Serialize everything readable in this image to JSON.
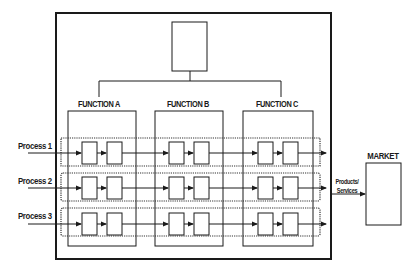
{
  "diagram": {
    "type": "process-function matrix organization diagram",
    "top_box": {
      "label": ""
    },
    "functions": [
      {
        "label": "FUNCTION A"
      },
      {
        "label": "FUNCTION B"
      },
      {
        "label": "FUNCTION C"
      }
    ],
    "processes": [
      {
        "label": "Process 1"
      },
      {
        "label": "Process 2"
      },
      {
        "label": "Process 3"
      }
    ],
    "output": {
      "label_line1": "Products/",
      "label_line2": "Services"
    },
    "market": {
      "label": "MARKET"
    },
    "colors": {
      "line": "#1a1a1a",
      "dotted": "#333333",
      "background": "#ffffff",
      "box_fill": "#ffffff"
    }
  }
}
